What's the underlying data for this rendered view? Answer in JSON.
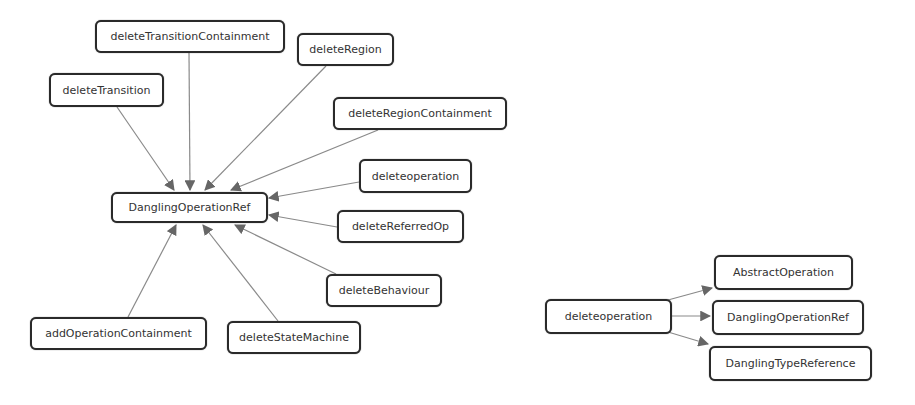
{
  "diagrams": [
    {
      "name": "left-graph",
      "nodes": [
        {
          "id": "n_center",
          "label": "DanglingOperationRef",
          "x": 111,
          "y": 192,
          "w": 157,
          "h": 31
        },
        {
          "id": "n1",
          "label": "deleteTransitionContainment",
          "x": 95,
          "y": 20,
          "w": 190,
          "h": 33
        },
        {
          "id": "n2",
          "label": "deleteRegion",
          "x": 297,
          "y": 33,
          "w": 97,
          "h": 33
        },
        {
          "id": "n3",
          "label": "deleteTransition",
          "x": 49,
          "y": 73,
          "w": 115,
          "h": 34
        },
        {
          "id": "n4",
          "label": "deleteRegionContainment",
          "x": 333,
          "y": 97,
          "w": 174,
          "h": 33
        },
        {
          "id": "n5",
          "label": "deleteoperation",
          "x": 359,
          "y": 159,
          "w": 113,
          "h": 34
        },
        {
          "id": "n6",
          "label": "deleteReferredOp",
          "x": 337,
          "y": 210,
          "w": 127,
          "h": 33
        },
        {
          "id": "n7",
          "label": "deleteBehaviour",
          "x": 326,
          "y": 274,
          "w": 116,
          "h": 33
        },
        {
          "id": "n8",
          "label": "addOperationContainment",
          "x": 30,
          "y": 317,
          "w": 177,
          "h": 33
        },
        {
          "id": "n9",
          "label": "deleteStateMachine",
          "x": 227,
          "y": 321,
          "w": 134,
          "h": 33
        }
      ],
      "edges": [
        {
          "from": "n1",
          "to": "n_center",
          "x1": 189,
          "y1": 53,
          "x2": 190,
          "y2": 190
        },
        {
          "from": "n2",
          "to": "n_center",
          "x1": 326,
          "y1": 66,
          "x2": 205,
          "y2": 190
        },
        {
          "from": "n3",
          "to": "n_center",
          "x1": 117,
          "y1": 107,
          "x2": 174,
          "y2": 190
        },
        {
          "from": "n4",
          "to": "n_center",
          "x1": 378,
          "y1": 130,
          "x2": 231,
          "y2": 190
        },
        {
          "from": "n5",
          "to": "n_center",
          "x1": 359,
          "y1": 182,
          "x2": 269,
          "y2": 198
        },
        {
          "from": "n6",
          "to": "n_center",
          "x1": 337,
          "y1": 227,
          "x2": 269,
          "y2": 215
        },
        {
          "from": "n7",
          "to": "n_center",
          "x1": 336,
          "y1": 274,
          "x2": 235,
          "y2": 225
        },
        {
          "from": "n8",
          "to": "n_center",
          "x1": 128,
          "y1": 317,
          "x2": 176,
          "y2": 225
        },
        {
          "from": "n9",
          "to": "n_center",
          "x1": 278,
          "y1": 321,
          "x2": 203,
          "y2": 225
        }
      ]
    },
    {
      "name": "right-graph",
      "nodes": [
        {
          "id": "r0",
          "label": "deleteoperation",
          "x": 545,
          "y": 299,
          "w": 127,
          "h": 35
        },
        {
          "id": "r1",
          "label": "AbstractOperation",
          "x": 714,
          "y": 255,
          "w": 139,
          "h": 35
        },
        {
          "id": "r2",
          "label": "DanglingOperationRef",
          "x": 712,
          "y": 300,
          "w": 152,
          "h": 35
        },
        {
          "id": "r3",
          "label": "DanglingTypeReference",
          "x": 709,
          "y": 346,
          "w": 163,
          "h": 35
        }
      ],
      "edges": [
        {
          "from": "r0",
          "to": "r1",
          "x1": 668,
          "y1": 300,
          "x2": 712,
          "y2": 288
        },
        {
          "from": "r0",
          "to": "r2",
          "x1": 672,
          "y1": 316,
          "x2": 710,
          "y2": 316
        },
        {
          "from": "r0",
          "to": "r3",
          "x1": 668,
          "y1": 332,
          "x2": 708,
          "y2": 344
        }
      ]
    }
  ],
  "colors": {
    "edge": "#8a8a8a",
    "arrowhead": "#666666",
    "node_border": "#2a2a2a"
  }
}
